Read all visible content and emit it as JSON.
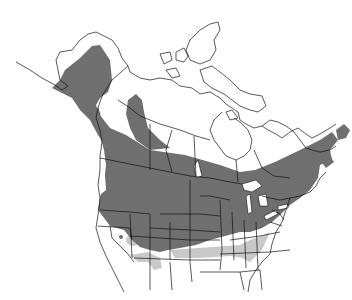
{
  "map": {
    "region": "North America",
    "type": "species range map",
    "colors": {
      "background": "#ffffff",
      "range_primary": "#6f6f6f",
      "range_secondary": "#c9c9c9",
      "borders": "#111111"
    },
    "legend": [],
    "labels": []
  }
}
